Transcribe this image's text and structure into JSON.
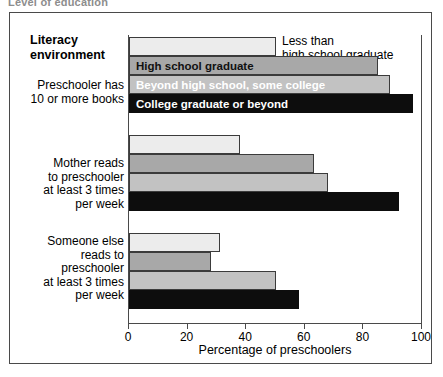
{
  "top_caption": "Level of education",
  "chart_data": {
    "type": "bar",
    "orientation": "horizontal",
    "title": "Literacy environment",
    "xlabel": "Percentage of preschoolers",
    "ylabel": "",
    "xlim": [
      0,
      100
    ],
    "xticks": [
      0,
      20,
      40,
      60,
      80,
      100
    ],
    "grid": false,
    "legend_position": "in-bar",
    "categories": [
      "Preschooler has 10 or more books",
      "Mother reads to preschooler at least 3 times per week",
      "Someone else reads to preschooler at least 3 times per week"
    ],
    "category_lines": [
      [
        "Preschooler has",
        "10 or more books"
      ],
      [
        "Mother reads",
        "to preschooler",
        "at least 3 times",
        "per week"
      ],
      [
        "Someone else",
        "reads to",
        "preschooler",
        "at least 3 times",
        "per week"
      ]
    ],
    "series": [
      {
        "name": "Less than high school graduate",
        "color": "#ececec",
        "values": [
          50,
          38,
          31
        ]
      },
      {
        "name": "High school graduate",
        "color": "#a8a8a8",
        "values": [
          85,
          63,
          28
        ]
      },
      {
        "name": "Beyond high school, some college",
        "color": "#c2c2c2",
        "values": [
          89,
          68,
          50
        ]
      },
      {
        "name": "College graduate or beyond",
        "color": "#0d0d0d",
        "values": [
          97,
          92,
          58
        ]
      }
    ],
    "annotations": [
      {
        "text": "Less than high school graduate",
        "lines": [
          "Less than",
          "high school graduate"
        ],
        "attached_to_group": 0,
        "attached_to_series": 0,
        "placement": "outside-right"
      }
    ]
  }
}
